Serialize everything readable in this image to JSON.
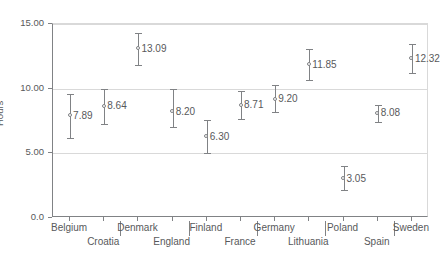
{
  "chart_data": {
    "type": "scatter",
    "title": "",
    "subtitle": "",
    "xlabel": "",
    "ylabel": "Hours",
    "ylim": [
      0,
      15
    ],
    "grid": true,
    "legend": "none",
    "marker_style": "open-circle-with-error-bars",
    "yticks": [
      {
        "value": 0,
        "label": "0.0"
      },
      {
        "value": 5,
        "label": "5.00"
      },
      {
        "value": 10,
        "label": "10.00"
      },
      {
        "value": 15,
        "label": "15.00"
      }
    ],
    "categories": [
      "Belgium",
      "Croatia",
      "Denmark",
      "England",
      "Finland",
      "France",
      "Germany",
      "Lithuania",
      "Poland",
      "Spain",
      "Sweden"
    ],
    "category_rows": {
      "top": [
        "Belgium",
        "Denmark",
        "Finland",
        "Germany",
        "Poland",
        "Sweden"
      ],
      "bottom": [
        "Croatia",
        "England",
        "France",
        "Lithuania",
        "Spain"
      ]
    },
    "values": [
      7.89,
      8.64,
      13.09,
      8.2,
      6.3,
      8.71,
      9.2,
      11.85,
      3.05,
      8.08,
      12.32
    ],
    "points": [
      {
        "category": "Belgium",
        "value": 7.89,
        "label": "7.89",
        "lower": 6.2,
        "upper": 9.6
      },
      {
        "category": "Croatia",
        "value": 8.64,
        "label": "8.64",
        "lower": 7.3,
        "upper": 10.0
      },
      {
        "category": "Denmark",
        "value": 13.09,
        "label": "13.09",
        "lower": 11.85,
        "upper": 14.3
      },
      {
        "category": "England",
        "value": 8.2,
        "label": "8.20",
        "lower": 7.05,
        "upper": 9.95
      },
      {
        "category": "Finland",
        "value": 6.3,
        "label": "6.30",
        "lower": 5.0,
        "upper": 7.6
      },
      {
        "category": "France",
        "value": 8.71,
        "label": "8.71",
        "lower": 7.65,
        "upper": 9.85
      },
      {
        "category": "Germany",
        "value": 9.2,
        "label": "9.20",
        "lower": 8.2,
        "upper": 10.3
      },
      {
        "category": "Lithuania",
        "value": 11.85,
        "label": "11.85",
        "lower": 10.65,
        "upper": 13.05
      },
      {
        "category": "Poland",
        "value": 3.05,
        "label": "3.05",
        "lower": 2.15,
        "upper": 4.0
      },
      {
        "category": "Spain",
        "value": 8.08,
        "label": "8.08",
        "lower": 7.45,
        "upper": 8.7
      },
      {
        "category": "Sweden",
        "value": 12.32,
        "label": "12.32",
        "lower": 11.2,
        "upper": 13.45
      }
    ],
    "colors": {
      "marker": "#808285",
      "errorbar": "#808285",
      "grid": "#d9d9d9",
      "axis": "#808285",
      "text": "#58595b",
      "background": "#ffffff"
    }
  }
}
